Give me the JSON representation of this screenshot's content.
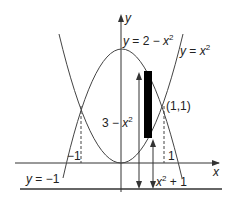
{
  "diagram": {
    "type": "area-between-curves",
    "axes": {
      "x_label": "x",
      "y_label": "y"
    },
    "curves": [
      {
        "name": "upper",
        "label_var": "y",
        "label_rest": " = 2 − ",
        "label_x": "x",
        "label_exp": "2"
      },
      {
        "name": "lower",
        "label_var": "y",
        "label_rest": " = ",
        "label_x": "x",
        "label_exp": "2"
      }
    ],
    "line": {
      "label_var": "y",
      "label_rest": " = −1"
    },
    "intersections": {
      "right_label": "(1,1)",
      "neg_tick": "−1",
      "pos_tick": "1"
    },
    "lengths": {
      "upper_length_prefix": "3 − ",
      "upper_length_x": "x",
      "upper_length_exp": "2",
      "lower_length_x": "x",
      "lower_length_exp": "2",
      "lower_length_suffix": " + 1"
    },
    "colors": {
      "stroke": "#333333",
      "rect": "#000000"
    }
  }
}
